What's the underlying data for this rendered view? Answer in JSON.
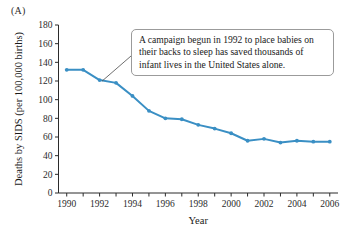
{
  "panel": {
    "label": "(A)"
  },
  "callout": {
    "text": "A campaign begun in 1992 to place babies on their backs to sleep has saved thousands of infant lives in the United States alone."
  },
  "style": {
    "series_color": "#3a8fc4",
    "axis_color": "#2b2b2b",
    "callout_border": "#9b9b9b",
    "leader_color": "#4a4a4a"
  },
  "chart_data": {
    "type": "line",
    "title": "",
    "xlabel": "Year",
    "ylabel": "Deaths by SIDS (per 100,000 births)",
    "xlim": [
      1989.5,
      2006.5
    ],
    "ylim": [
      0,
      180
    ],
    "grid": false,
    "legend": null,
    "y_ticks": [
      0,
      20,
      40,
      60,
      80,
      100,
      120,
      140,
      160,
      180
    ],
    "y_tick_labels": [
      "0",
      "20",
      "40",
      "60",
      "80",
      "100",
      "120",
      "140",
      "160",
      "180"
    ],
    "x_ticks": [
      1990,
      1991,
      1992,
      1993,
      1994,
      1995,
      1996,
      1997,
      1998,
      1999,
      2000,
      2001,
      2002,
      2003,
      2004,
      2005,
      2006
    ],
    "x_tick_labels_shown": [
      "1990",
      "1992",
      "1994",
      "1996",
      "1998",
      "2000",
      "2002",
      "2004",
      "2006"
    ],
    "x": [
      1990,
      1991,
      1992,
      1993,
      1994,
      1995,
      1996,
      1997,
      1998,
      1999,
      2000,
      2001,
      2002,
      2003,
      2004,
      2005,
      2006
    ],
    "values": [
      132,
      132,
      121,
      118,
      104,
      88,
      80,
      79,
      73,
      69,
      64,
      56,
      58,
      54,
      56,
      55,
      55
    ],
    "annotations": [
      {
        "text": "A campaign begun in 1992 to place babies on their backs to sleep has saved thousands of infant lives in the United States alone.",
        "points_to_year": 1992,
        "points_to_value": 121
      }
    ]
  }
}
